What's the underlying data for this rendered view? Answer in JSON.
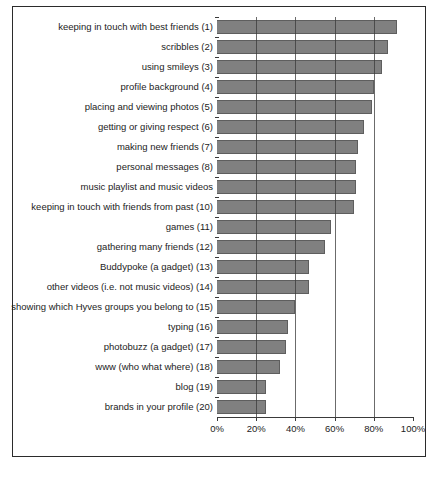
{
  "chart_data": {
    "type": "bar",
    "orientation": "horizontal",
    "title": "",
    "subtitle": "",
    "xlabel": "",
    "ylabel": "",
    "xlim": [
      0,
      100
    ],
    "xticks": [
      "0%",
      "20%",
      "40%",
      "60%",
      "80%",
      "100%"
    ],
    "xtick_values": [
      0,
      20,
      40,
      60,
      80,
      100
    ],
    "grid": true,
    "gridlines_at": [
      20,
      40,
      60,
      80
    ],
    "legend": null,
    "bar_color": "#808080",
    "bar_edge_color": "#5e5e5e",
    "axis_color": "#3a3a3a",
    "categories": [
      "keeping in touch with best friends (1)",
      "scribbles (2)",
      "using smileys (3)",
      "profile background (4)",
      "placing and viewing photos (5)",
      "getting or giving respect (6)",
      "making new friends (7)",
      "personal messages (8)",
      "music playlist and music videos",
      "keeping in touch with friends from past (10)",
      "games (11)",
      "gathering many friends (12)",
      "Buddypoke (a gadget) (13)",
      "other videos (i.e. not music videos) (14)",
      "showing which Hyves groups you belong to (15)",
      "typing (16)",
      "photobuzz (a gadget) (17)",
      "www (who what where) (18)",
      "blog (19)",
      "brands in your profile (20)"
    ],
    "values": [
      92,
      87,
      84,
      80,
      79,
      75,
      72,
      71,
      71,
      70,
      58,
      55,
      47,
      47,
      40,
      36,
      35,
      32,
      25,
      25
    ]
  }
}
